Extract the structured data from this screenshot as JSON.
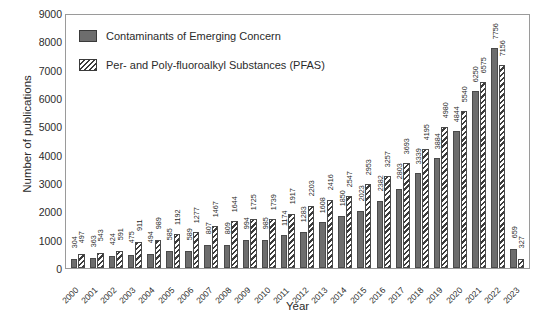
{
  "chart_data": {
    "type": "bar",
    "title": "",
    "xlabel": "Year",
    "ylabel": "Number of publications",
    "ylim": [
      0,
      9000
    ],
    "ytick_step": 1000,
    "yticks": [
      0,
      1000,
      2000,
      3000,
      4000,
      5000,
      6000,
      7000,
      8000,
      9000
    ],
    "grid": false,
    "legend_position": "top-left-inside",
    "categories": [
      "2000",
      "2001",
      "2002",
      "2003",
      "2004",
      "2005",
      "2006",
      "2007",
      "2008",
      "2009",
      "2010",
      "2011",
      "2012",
      "2013",
      "2014",
      "2015",
      "2016",
      "2017",
      "2018",
      "2019",
      "2020",
      "2021",
      "2022",
      "2023"
    ],
    "series": [
      {
        "name": "Contaminants of Emerging Concern",
        "pattern": "solid",
        "color": "#6d6d6d",
        "values": [
          304,
          363,
          424,
          475,
          494,
          585,
          589,
          807,
          809,
          994,
          985,
          1174,
          1283,
          1608,
          1850,
          2023,
          2382,
          2803,
          3339,
          3884,
          4844,
          6250,
          7756,
          659
        ]
      },
      {
        "name": "Per- and Poly-fluoroalkyl Substances (PFAS)",
        "pattern": "diagonal-hatch",
        "color": "#3c3c3c",
        "values": [
          497,
          543,
          591,
          911,
          989,
          1192,
          1277,
          1467,
          1644,
          1725,
          1739,
          1917,
          2203,
          2416,
          2547,
          2953,
          3257,
          3693,
          4195,
          4980,
          5540,
          6575,
          7156,
          327
        ]
      }
    ]
  },
  "legend": {
    "items": [
      {
        "label": "Contaminants of Emerging Concern",
        "swatch": "solid-swatch"
      },
      {
        "label": "Per- and Poly-fluoroalkyl Substances (PFAS)",
        "swatch": "hatch-swatch"
      }
    ]
  },
  "axes": {
    "y_title": "Number of publications",
    "x_title": "Year"
  }
}
